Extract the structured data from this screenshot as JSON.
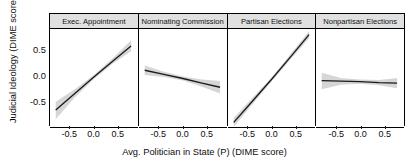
{
  "axes": {
    "ylabel": "Judicial Ideology (DIME score)",
    "xlabel": "Avg. Politician in State (P) (DIME score)",
    "yticks": [
      "0.5",
      "0.0",
      "-0.5"
    ],
    "ytick_values": [
      0.5,
      0.0,
      -0.5
    ],
    "xticks": [
      "-0.5",
      "0.0",
      "0.5"
    ],
    "xtick_values": [
      -0.5,
      0.0,
      0.5
    ]
  },
  "panels": [
    {
      "label": "Exec. Appointment"
    },
    {
      "label": "Nominating Commission"
    },
    {
      "label": "Partisan Elections"
    },
    {
      "label": "Nonpartisan Elections"
    }
  ],
  "colors": {
    "line": "#1a1a1a",
    "ribbon": "#bdbdbd",
    "strip_fill": "#e0e0e0",
    "panel_border": "#000000",
    "background": "#ffffff"
  },
  "chart_data": {
    "type": "line",
    "title": "",
    "xlabel": "Avg. Politician in State (P) (DIME score)",
    "ylabel": "Judicial Ideology (DIME score)",
    "xlim": [
      -0.92,
      0.92
    ],
    "ylim": [
      -0.95,
      0.95
    ],
    "grid": false,
    "legend": "none",
    "facet_variable": "Judicial Selection Method",
    "annotations": "Grey bands are confidence intervals around each fitted regression line.",
    "series": [
      {
        "name": "Exec. Appointment",
        "x": [
          -0.8,
          -0.4,
          0.0,
          0.4,
          0.78
        ],
        "values": [
          -0.62,
          -0.3,
          0.02,
          0.33,
          0.62
        ],
        "ci_low": [
          -0.8,
          -0.38,
          -0.02,
          0.28,
          0.52
        ],
        "ci_high": [
          -0.46,
          -0.22,
          0.06,
          0.39,
          0.73
        ]
      },
      {
        "name": "Nominating Commission",
        "x": [
          -0.8,
          -0.4,
          0.0,
          0.4,
          0.78
        ],
        "values": [
          0.15,
          0.07,
          -0.01,
          -0.1,
          -0.18
        ],
        "ci_low": [
          0.06,
          0.02,
          -0.05,
          -0.17,
          -0.3
        ],
        "ci_high": [
          0.24,
          0.12,
          0.03,
          -0.03,
          -0.06
        ]
      },
      {
        "name": "Partisan Elections",
        "x": [
          -0.8,
          -0.4,
          0.0,
          0.4,
          0.78
        ],
        "values": [
          -0.86,
          -0.44,
          -0.02,
          0.42,
          0.84
        ],
        "ci_low": [
          -0.95,
          -0.5,
          -0.06,
          0.37,
          0.77
        ],
        "ci_high": [
          -0.77,
          -0.38,
          0.02,
          0.47,
          0.91
        ]
      },
      {
        "name": "Nonpartisan Elections",
        "x": [
          -0.8,
          -0.4,
          0.0,
          0.4,
          0.78
        ],
        "values": [
          -0.05,
          -0.06,
          -0.07,
          -0.09,
          -0.1
        ],
        "ci_low": [
          -0.22,
          -0.13,
          -0.11,
          -0.14,
          -0.2
        ],
        "ci_high": [
          0.1,
          0.0,
          -0.03,
          -0.04,
          0.0
        ]
      }
    ]
  }
}
